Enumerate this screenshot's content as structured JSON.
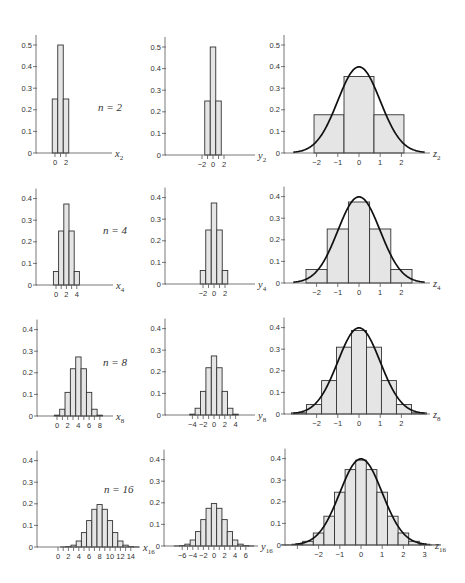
{
  "figure": {
    "layout": "4 rows x 3 columns of histograms",
    "row_labels": [
      "n = 2",
      "n = 4",
      "n = 8",
      "n = 16"
    ]
  },
  "chart_data": [
    {
      "row": 1,
      "col": 1,
      "type": "bar",
      "n": 2,
      "variable": "x",
      "subscript": "2",
      "x": [
        0,
        1,
        2
      ],
      "values": [
        0.25,
        0.5,
        0.25
      ],
      "bin_width": 1,
      "xticks": [
        0,
        1,
        2
      ],
      "xtick_labels": [
        "0",
        "",
        "2"
      ],
      "yticks": [
        0,
        0.1,
        0.2,
        0.3,
        0.4,
        0.5
      ],
      "ytick_labels": [
        "0",
        "0.1",
        "0.2",
        "0.3",
        "0.4",
        "0.5"
      ],
      "ylim": [
        0,
        0.5
      ],
      "annotation": "n = 2"
    },
    {
      "row": 1,
      "col": 2,
      "type": "bar",
      "n": 2,
      "variable": "y",
      "subscript": "2",
      "x": [
        -1,
        0,
        1
      ],
      "values": [
        0.25,
        0.5,
        0.25
      ],
      "bin_width": 1,
      "xticks": [
        -2,
        -1,
        0,
        1,
        2
      ],
      "xtick_labels": [
        "−2",
        "",
        "0",
        "",
        "2"
      ],
      "yticks": [
        0,
        0.1,
        0.2,
        0.3,
        0.4,
        0.5
      ],
      "ytick_labels": [
        "0",
        "0.1",
        "0.2",
        "0.3",
        "0.4",
        "0.5"
      ],
      "ylim": [
        0,
        0.5
      ]
    },
    {
      "row": 1,
      "col": 3,
      "type": "bar",
      "n": 2,
      "variable": "z",
      "subscript": "2",
      "x": [
        -1.414,
        0,
        1.414
      ],
      "values": [
        0.177,
        0.354,
        0.177
      ],
      "bin_width": 1.414,
      "xticks": [
        -2,
        -1,
        0,
        1,
        2
      ],
      "xtick_labels": [
        "−2",
        "−1",
        "0",
        "1",
        "2"
      ],
      "yticks": [
        0,
        0.1,
        0.2,
        0.3,
        0.4,
        0.5
      ],
      "ytick_labels": [
        "0",
        "0.1",
        "0.2",
        "0.3",
        "0.4",
        "0.5"
      ],
      "ylim": [
        0,
        0.5
      ],
      "overlay": {
        "type": "line",
        "name": "standard normal density",
        "x": [
          -3.1,
          -3,
          -2.5,
          -2,
          -1.5,
          -1,
          -0.5,
          0,
          0.5,
          1,
          1.5,
          2,
          2.5,
          3,
          3.1
        ],
        "y": [
          0.0033,
          0.0044,
          0.0175,
          0.054,
          0.1295,
          0.242,
          0.3521,
          0.3989,
          0.3521,
          0.242,
          0.1295,
          0.054,
          0.0175,
          0.0044,
          0.0033
        ]
      }
    },
    {
      "row": 2,
      "col": 1,
      "type": "bar",
      "n": 4,
      "variable": "x",
      "subscript": "4",
      "x": [
        0,
        1,
        2,
        3,
        4
      ],
      "values": [
        0.0625,
        0.25,
        0.375,
        0.25,
        0.0625
      ],
      "bin_width": 1,
      "xticks": [
        0,
        1,
        2,
        3,
        4
      ],
      "xtick_labels": [
        "0",
        "",
        "2",
        "",
        "4"
      ],
      "yticks": [
        0,
        0.1,
        0.2,
        0.3,
        0.4
      ],
      "ytick_labels": [
        "0",
        "0.1",
        "0.2",
        "0.3",
        "0.4"
      ],
      "ylim": [
        0,
        0.4
      ],
      "annotation": "n = 4"
    },
    {
      "row": 2,
      "col": 2,
      "type": "bar",
      "n": 4,
      "variable": "y",
      "subscript": "4",
      "x": [
        -2,
        -1,
        0,
        1,
        2
      ],
      "values": [
        0.0625,
        0.25,
        0.375,
        0.25,
        0.0625
      ],
      "bin_width": 1,
      "xticks": [
        -2,
        -1,
        0,
        1,
        2
      ],
      "xtick_labels": [
        "−2",
        "",
        "0",
        "",
        "2"
      ],
      "yticks": [
        0,
        0.1,
        0.2,
        0.3,
        0.4
      ],
      "ytick_labels": [
        "0",
        "0.1",
        "0.2",
        "0.3",
        "0.4"
      ],
      "ylim": [
        0,
        0.4
      ]
    },
    {
      "row": 2,
      "col": 3,
      "type": "bar",
      "n": 4,
      "variable": "z",
      "subscript": "4",
      "x": [
        -2,
        -1,
        0,
        1,
        2
      ],
      "values": [
        0.0625,
        0.25,
        0.375,
        0.25,
        0.0625
      ],
      "bin_width": 1,
      "xticks": [
        -2,
        -1,
        0,
        1,
        2
      ],
      "xtick_labels": [
        "−2",
        "−1",
        "0",
        "1",
        "2"
      ],
      "yticks": [
        0,
        0.1,
        0.2,
        0.3,
        0.4
      ],
      "ytick_labels": [
        "0",
        "0.1",
        "0.2",
        "0.3",
        "0.4"
      ],
      "ylim": [
        0,
        0.4
      ],
      "overlay": {
        "type": "line",
        "name": "standard normal density",
        "x": [
          -3.1,
          -3,
          -2.5,
          -2,
          -1.5,
          -1,
          -0.5,
          0,
          0.5,
          1,
          1.5,
          2,
          2.5,
          3,
          3.1
        ],
        "y": [
          0.0033,
          0.0044,
          0.0175,
          0.054,
          0.1295,
          0.242,
          0.3521,
          0.3989,
          0.3521,
          0.242,
          0.1295,
          0.054,
          0.0175,
          0.0044,
          0.0033
        ]
      }
    },
    {
      "row": 3,
      "col": 1,
      "type": "bar",
      "n": 8,
      "variable": "x",
      "subscript": "8",
      "x": [
        0,
        1,
        2,
        3,
        4,
        5,
        6,
        7,
        8
      ],
      "values": [
        0.0039,
        0.0313,
        0.1094,
        0.2188,
        0.2734,
        0.2188,
        0.1094,
        0.0313,
        0.0039
      ],
      "bin_width": 1,
      "xticks": [
        0,
        1,
        2,
        3,
        4,
        5,
        6,
        7,
        8
      ],
      "xtick_labels": [
        "0",
        "",
        "2",
        "",
        "4",
        "",
        "6",
        "",
        "8"
      ],
      "yticks": [
        0,
        0.1,
        0.2,
        0.3,
        0.4
      ],
      "ytick_labels": [
        "0",
        "0.1",
        "0.2",
        "0.3",
        "0.4"
      ],
      "ylim": [
        0,
        0.4
      ],
      "annotation": "n = 8"
    },
    {
      "row": 3,
      "col": 2,
      "type": "bar",
      "n": 8,
      "variable": "y",
      "subscript": "8",
      "x": [
        -4,
        -3,
        -2,
        -1,
        0,
        1,
        2,
        3,
        4
      ],
      "values": [
        0.0039,
        0.0313,
        0.1094,
        0.2188,
        0.2734,
        0.2188,
        0.1094,
        0.0313,
        0.0039
      ],
      "bin_width": 1,
      "xticks": [
        -4,
        -3,
        -2,
        -1,
        0,
        1,
        2,
        3,
        4
      ],
      "xtick_labels": [
        "−4",
        "",
        "−2",
        "",
        "0",
        "",
        "2",
        "",
        "4"
      ],
      "yticks": [
        0,
        0.1,
        0.2,
        0.3,
        0.4
      ],
      "ytick_labels": [
        "0",
        "0.1",
        "0.2",
        "0.3",
        "0.4"
      ],
      "ylim": [
        0,
        0.4
      ]
    },
    {
      "row": 3,
      "col": 3,
      "type": "bar",
      "n": 8,
      "variable": "z",
      "subscript": "8",
      "x": [
        -2.83,
        -2.12,
        -1.41,
        -0.71,
        0,
        0.71,
        1.41,
        2.12,
        2.83
      ],
      "values": [
        0.0055,
        0.0442,
        0.1547,
        0.3094,
        0.3867,
        0.3094,
        0.1547,
        0.0442,
        0.0055
      ],
      "bin_width": 0.707,
      "xticks": [
        -2,
        -1,
        0,
        1,
        2
      ],
      "xtick_labels": [
        "−2",
        "−1",
        "0",
        "1",
        "2"
      ],
      "yticks": [
        0,
        0.1,
        0.2,
        0.3,
        0.4
      ],
      "ytick_labels": [
        "0",
        "0.1",
        "0.2",
        "0.3",
        "0.4"
      ],
      "ylim": [
        0,
        0.4
      ],
      "overlay": {
        "type": "line",
        "name": "standard normal density",
        "x": [
          -3.1,
          -3,
          -2.5,
          -2,
          -1.5,
          -1,
          -0.5,
          0,
          0.5,
          1,
          1.5,
          2,
          2.5,
          3,
          3.1
        ],
        "y": [
          0.0033,
          0.0044,
          0.0175,
          0.054,
          0.1295,
          0.242,
          0.3521,
          0.3989,
          0.3521,
          0.242,
          0.1295,
          0.054,
          0.0175,
          0.0044,
          0.0033
        ]
      }
    },
    {
      "row": 4,
      "col": 1,
      "type": "bar",
      "n": 16,
      "variable": "x",
      "subscript": "16",
      "x": [
        0,
        1,
        2,
        3,
        4,
        5,
        6,
        7,
        8,
        9,
        10,
        11,
        12,
        13,
        14,
        15,
        16
      ],
      "values": [
        2e-05,
        0.0002,
        0.0018,
        0.0085,
        0.0278,
        0.0667,
        0.1222,
        0.1746,
        0.1964,
        0.1746,
        0.1222,
        0.0667,
        0.0278,
        0.0085,
        0.0018,
        0.0002,
        2e-05
      ],
      "bin_width": 1,
      "xticks": [
        0,
        1,
        2,
        3,
        4,
        5,
        6,
        7,
        8,
        9,
        10,
        11,
        12,
        13,
        14
      ],
      "xtick_labels": [
        "0",
        "",
        "2",
        "",
        "4",
        "",
        "6",
        "",
        "8",
        "",
        "10",
        "",
        "12",
        "",
        "14"
      ],
      "yticks": [
        0,
        0.1,
        0.2,
        0.3,
        0.4
      ],
      "ytick_labels": [
        "0",
        "0.1",
        "0.2",
        "0.3",
        "0.4"
      ],
      "ylim": [
        0,
        0.4
      ],
      "annotation": "n = 16"
    },
    {
      "row": 4,
      "col": 2,
      "type": "bar",
      "n": 16,
      "variable": "y",
      "subscript": "16",
      "x": [
        -8,
        -7,
        -6,
        -5,
        -4,
        -3,
        -2,
        -1,
        0,
        1,
        2,
        3,
        4,
        5,
        6,
        7,
        8
      ],
      "values": [
        2e-05,
        0.0002,
        0.0018,
        0.0085,
        0.0278,
        0.0667,
        0.1222,
        0.1746,
        0.1964,
        0.1746,
        0.1222,
        0.0667,
        0.0278,
        0.0085,
        0.0018,
        0.0002,
        2e-05
      ],
      "bin_width": 1,
      "xticks": [
        -6,
        -5,
        -4,
        -3,
        -2,
        -1,
        0,
        1,
        2,
        3,
        4,
        5,
        6
      ],
      "xtick_labels": [
        "−6",
        "",
        "−4",
        "",
        "−2",
        "",
        "0",
        "",
        "2",
        "",
        "4",
        "",
        "6"
      ],
      "yticks": [
        0,
        0.1,
        0.2,
        0.3,
        0.4
      ],
      "ytick_labels": [
        "0",
        "0.1",
        "0.2",
        "0.3",
        "0.4"
      ],
      "ylim": [
        0,
        0.4
      ]
    },
    {
      "row": 4,
      "col": 3,
      "type": "bar",
      "n": 16,
      "variable": "z",
      "subscript": "16",
      "x": [
        -3.5,
        -3,
        -2.5,
        -2,
        -1.5,
        -1,
        -0.5,
        0,
        0.5,
        1,
        1.5,
        2,
        2.5,
        3,
        3.5
      ],
      "values": [
        0.0005,
        0.0037,
        0.0171,
        0.0555,
        0.1333,
        0.2444,
        0.3491,
        0.3928,
        0.3491,
        0.2444,
        0.1333,
        0.0555,
        0.0171,
        0.0037,
        0.0005
      ],
      "bin_width": 0.5,
      "xticks": [
        -3,
        -2,
        -1,
        0,
        1,
        2,
        3
      ],
      "xtick_labels": [
        "",
        "−2",
        "−1",
        "0",
        "1",
        "2",
        "3"
      ],
      "yticks": [
        0,
        0.1,
        0.2,
        0.3,
        0.4
      ],
      "ytick_labels": [
        "0",
        "0.1",
        "0.2",
        "0.3",
        "0.4"
      ],
      "ylim": [
        0,
        0.4
      ],
      "overlay": {
        "type": "line",
        "name": "standard normal density",
        "x": [
          -3.1,
          -3,
          -2.5,
          -2,
          -1.5,
          -1,
          -0.5,
          0,
          0.5,
          1,
          1.5,
          2,
          2.5,
          3,
          3.1
        ],
        "y": [
          0.0033,
          0.0044,
          0.0175,
          0.054,
          0.1295,
          0.242,
          0.3521,
          0.3989,
          0.3521,
          0.242,
          0.1295,
          0.054,
          0.0175,
          0.0044,
          0.0033
        ]
      }
    }
  ]
}
